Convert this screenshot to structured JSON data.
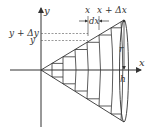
{
  "diagram": {
    "axes": {
      "x_label": "x",
      "y_label": "y"
    },
    "labels": {
      "x": "x",
      "x_plus_dx": "x + Δx",
      "dx": "dx",
      "y_plus_dy": "y + Δy",
      "y": "y",
      "r": "r",
      "h": "h"
    },
    "colors": {
      "stroke": "#333333",
      "background": "#ffffff"
    },
    "geometry": {
      "origin": [
        41,
        70
      ],
      "base_x": 124,
      "base_top_y": 20,
      "base_bottom_y": 122,
      "slice_x": [
        52,
        63,
        75,
        87,
        99,
        111
      ]
    }
  }
}
